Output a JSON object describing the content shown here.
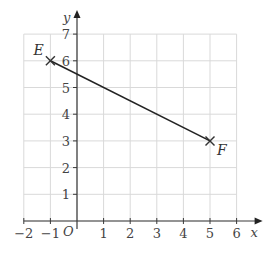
{
  "chart_data": {
    "type": "line",
    "title": "",
    "xlabel": "x",
    "ylabel": "y",
    "origin_label": "O",
    "xlim": [
      -2,
      6
    ],
    "ylim": [
      0,
      7
    ],
    "x_ticks": [
      -2,
      -1,
      1,
      2,
      3,
      4,
      5,
      6
    ],
    "y_ticks": [
      1,
      2,
      3,
      4,
      5,
      6,
      7
    ],
    "x_tick_labels": [
      "−2",
      "−1",
      "1",
      "2",
      "3",
      "4",
      "5",
      "6"
    ],
    "y_tick_labels": [
      "1",
      "2",
      "3",
      "4",
      "5",
      "6",
      "7"
    ],
    "grid": true,
    "series": [
      {
        "name": "EF",
        "points": [
          {
            "label": "E",
            "x": -1,
            "y": 6,
            "marker": "cross"
          },
          {
            "label": "F",
            "x": 5,
            "y": 3,
            "marker": "cross"
          }
        ]
      }
    ],
    "colors": {
      "grid": "#d9d9d9",
      "axis": "#3a3a3a",
      "line": "#222222"
    }
  }
}
